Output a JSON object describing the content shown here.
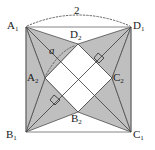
{
  "figure": {
    "type": "geometry-diagram",
    "width": 155,
    "height": 150,
    "colors": {
      "background": "#ffffff",
      "triangle_fill": "#bfbfbf",
      "inner_square_fill": "#ffffff",
      "stroke": "#4d4d4d",
      "label": "#1a1a1a",
      "dotted": "#555555"
    }
  },
  "labels": {
    "outer": {
      "top_left": "A",
      "top_left_sub": "1",
      "top_right": "D",
      "top_right_sub": "1",
      "bottom_left": "B",
      "bottom_left_sub": "1",
      "bottom_right": "C",
      "bottom_right_sub": "1"
    },
    "inner": {
      "top": "D",
      "top_sub": "2",
      "left": "A",
      "left_sub": "2",
      "bottom": "B",
      "bottom_sub": "2",
      "right": "C",
      "right_sub": "2"
    },
    "measures": {
      "side_length": "2",
      "angle": "a"
    }
  },
  "geometry": {
    "outer_square": {
      "A1": [
        26,
        27
      ],
      "D1": [
        131,
        27
      ],
      "C1": [
        131,
        132
      ],
      "B1": [
        26,
        132
      ]
    },
    "inner_square": {
      "D2": [
        78,
        44
      ],
      "C2": [
        112,
        78
      ],
      "B2": [
        78,
        112
      ],
      "A2": [
        45,
        78
      ]
    },
    "diagonals": [
      {
        "from": "A1",
        "to": "C1"
      },
      {
        "from": "B1",
        "to": "D1"
      }
    ],
    "right_angle_markers": [
      {
        "at": [
          100,
          57
        ],
        "on": "D1-B1 diagonal near C2 side"
      },
      {
        "at": [
          56,
          100
        ],
        "on": "A1-C1 diagonal near A2 side"
      }
    ],
    "arcs": [
      {
        "name": "top-span-arc",
        "label": "2",
        "from": "A1",
        "to": "D1",
        "style": "dotted"
      },
      {
        "name": "angle-arc",
        "label": "a",
        "vertex": "A2",
        "style": "dotted"
      }
    ]
  }
}
